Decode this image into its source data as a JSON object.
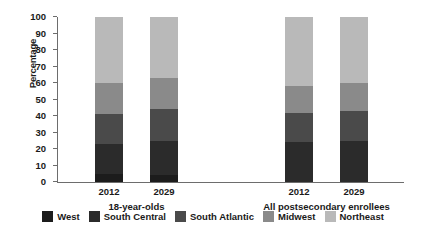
{
  "chart_data": {
    "type": "bar",
    "title": "",
    "subtitle": "",
    "xlabel": "",
    "ylabel": "Percentage",
    "ylim": [
      0,
      100
    ],
    "yticks": [
      0,
      10,
      20,
      30,
      40,
      50,
      60,
      70,
      80,
      90,
      100
    ],
    "grid": false,
    "stacked": true,
    "legend_position": "bottom",
    "categories": [
      "2012",
      "2029",
      "2012",
      "2029"
    ],
    "groups": [
      {
        "label": "18-year-olds",
        "categories": [
          "2012",
          "2029"
        ]
      },
      {
        "label": "All postsecondary enrollees",
        "categories": [
          "2012",
          "2029"
        ]
      }
    ],
    "series": [
      {
        "name": "West",
        "color": "#1c1c1c",
        "values": [
          5,
          4,
          0,
          0
        ]
      },
      {
        "name": "South Central",
        "color": "#2b2b2b",
        "values": [
          18,
          21,
          24,
          25
        ]
      },
      {
        "name": "South Atlantic",
        "color": "#4a4a4a",
        "values": [
          18,
          19,
          18,
          18
        ]
      },
      {
        "name": "Midwest",
        "color": "#8a8a8a",
        "values": [
          19,
          19,
          16,
          17
        ]
      },
      {
        "name": "Northeast",
        "color": "#b9b9b9",
        "values": [
          40,
          37,
          42,
          40
        ]
      }
    ],
    "cumulative_tops": [
      [
        5,
        23,
        41,
        60,
        100
      ],
      [
        4,
        25,
        44,
        63,
        100
      ],
      [
        0,
        24,
        42,
        58,
        100
      ],
      [
        0,
        25,
        43,
        60,
        100
      ]
    ],
    "bars": [
      {
        "group": "18-year-olds",
        "category": "2012",
        "segments": [
          {
            "name": "West",
            "from": 0,
            "to": 5
          },
          {
            "name": "South Central",
            "from": 5,
            "to": 23
          },
          {
            "name": "South Atlantic",
            "from": 23,
            "to": 41
          },
          {
            "name": "Midwest",
            "from": 41,
            "to": 60
          },
          {
            "name": "Northeast",
            "from": 60,
            "to": 83
          },
          {
            "name": "Northeast",
            "from": 83,
            "to": 100
          }
        ]
      },
      {
        "group": "18-year-olds",
        "category": "2029",
        "segments": [
          {
            "name": "West",
            "from": 0,
            "to": 4
          },
          {
            "name": "South Central",
            "from": 4,
            "to": 25
          },
          {
            "name": "South Atlantic",
            "from": 25,
            "to": 44
          },
          {
            "name": "Midwest",
            "from": 44,
            "to": 63
          },
          {
            "name": "Northeast",
            "from": 63,
            "to": 83
          },
          {
            "name": "Northeast",
            "from": 83,
            "to": 100
          }
        ]
      },
      {
        "group": "All postsecondary enrollees",
        "category": "2012",
        "segments": [
          {
            "name": "South Central",
            "from": 0,
            "to": 24
          },
          {
            "name": "South Atlantic",
            "from": 24,
            "to": 42
          },
          {
            "name": "Midwest",
            "from": 42,
            "to": 58
          },
          {
            "name": "Northeast",
            "from": 58,
            "to": 79
          },
          {
            "name": "Northeast",
            "from": 79,
            "to": 100
          }
        ]
      },
      {
        "group": "All postsecondary enrollees",
        "category": "2029",
        "segments": [
          {
            "name": "South Central",
            "from": 0,
            "to": 25
          },
          {
            "name": "South Atlantic",
            "from": 25,
            "to": 43
          },
          {
            "name": "Midwest",
            "from": 43,
            "to": 60
          },
          {
            "name": "Northeast",
            "from": 60,
            "to": 80
          },
          {
            "name": "Northeast",
            "from": 80,
            "to": 100
          }
        ]
      }
    ],
    "legend": [
      {
        "label": "West",
        "color": "#1c1c1c"
      },
      {
        "label": "South Central",
        "color": "#2b2b2b"
      },
      {
        "label": "South Atlantic",
        "color": "#4a4a4a"
      },
      {
        "label": "Midwest",
        "color": "#8a8a8a"
      },
      {
        "label": "Northeast",
        "color": "#b9b9b9"
      }
    ]
  },
  "axis": {
    "y_title": "Percentage"
  },
  "palette": {
    "axis": "#6d6d6d",
    "text": "#1a1a1a",
    "background": "#ffffff"
  }
}
